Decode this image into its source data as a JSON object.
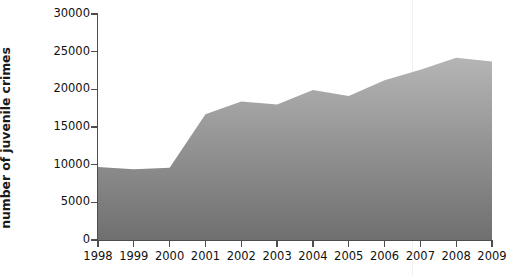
{
  "chart_data": {
    "type": "area",
    "title": "",
    "xlabel": "",
    "ylabel": "number of juvenile crimes",
    "categories": [
      "1998",
      "1999",
      "2000",
      "2001",
      "2002",
      "2003",
      "2004",
      "2005",
      "2006",
      "2007",
      "2008",
      "2009"
    ],
    "values": [
      9700,
      9400,
      9600,
      16700,
      18400,
      18000,
      19900,
      19100,
      21200,
      22600,
      24200,
      23700
    ],
    "series": [
      {
        "name": "number of juvenile crimes",
        "values": [
          9700,
          9400,
          9600,
          16700,
          18400,
          18000,
          19900,
          19100,
          21200,
          22600,
          24200,
          23700
        ]
      }
    ],
    "ylim": [
      0,
      30000
    ],
    "xlim": [
      "1998",
      "2009"
    ],
    "y_ticks": [
      0,
      5000,
      10000,
      15000,
      20000,
      25000,
      30000
    ],
    "y_tick_labels": [
      "0",
      "5000",
      "10000",
      "15000",
      "20000",
      "25000",
      "30000"
    ],
    "x_ticks": [
      "1998",
      "1999",
      "2000",
      "2001",
      "2002",
      "2003",
      "2004",
      "2005",
      "2006",
      "2007",
      "2008",
      "2009"
    ],
    "grid": false,
    "legend": false,
    "legend_position": "none",
    "fill_color_top": "#b5b5b5",
    "fill_color_bottom": "#6f6f6f",
    "axis_color": "#4d4d4d",
    "text_color": "#111111"
  }
}
